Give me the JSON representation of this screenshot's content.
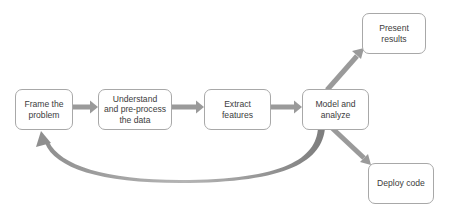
{
  "diagram": {
    "type": "flowchart",
    "arrow_color": "#9a9a9a",
    "node_border_color": "#a8a8a8",
    "text_color": "#3c3c3c",
    "nodes": [
      {
        "id": "frame",
        "label": "Frame the\nproblem"
      },
      {
        "id": "understand",
        "label": "Understand\nand pre-process\nthe data"
      },
      {
        "id": "extract",
        "label": "Extract\nfeatures"
      },
      {
        "id": "model",
        "label": "Model and\nanalyze"
      },
      {
        "id": "present",
        "label": "Present\nresults"
      },
      {
        "id": "deploy",
        "label": "Deploy code"
      }
    ],
    "edges": [
      {
        "from": "frame",
        "to": "understand"
      },
      {
        "from": "understand",
        "to": "extract"
      },
      {
        "from": "extract",
        "to": "model"
      },
      {
        "from": "model",
        "to": "present"
      },
      {
        "from": "model",
        "to": "deploy"
      },
      {
        "from": "model",
        "to": "frame",
        "style": "curved-feedback"
      }
    ]
  }
}
